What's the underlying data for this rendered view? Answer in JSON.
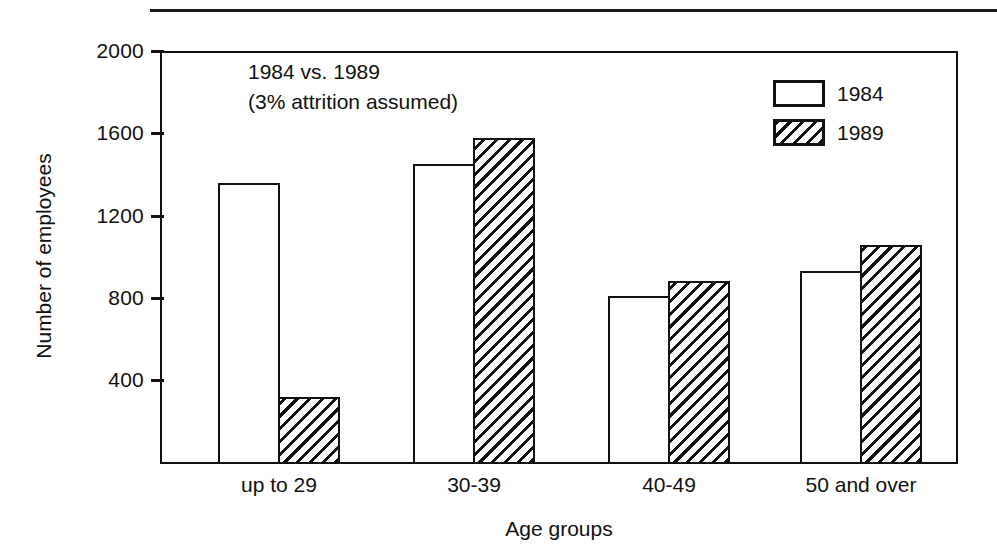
{
  "chart_data": {
    "type": "bar",
    "title": "",
    "annotation": [
      "1984 vs. 1989",
      "(3% attrition assumed)"
    ],
    "categories": [
      "up to 29",
      "30-39",
      "40-49",
      "50 and over"
    ],
    "series": [
      {
        "name": "1984",
        "fill": "white",
        "values": [
          1360,
          1455,
          815,
          935
        ]
      },
      {
        "name": "1989",
        "fill": "hatched",
        "values": [
          325,
          1580,
          885,
          1060
        ]
      }
    ],
    "xlabel": "Age groups",
    "ylabel": "Number of employees",
    "ylim": [
      0,
      2000
    ],
    "yticks": [
      400,
      800,
      1200,
      1600,
      2000
    ],
    "ytick_labels": [
      "400",
      "800",
      "1200",
      "1600",
      "2000"
    ],
    "grid": false,
    "legend_position": "top-right",
    "legend_entries": [
      "1984",
      "1989"
    ],
    "colors": {
      "ink": "#111111",
      "background": "#ffffff"
    }
  }
}
